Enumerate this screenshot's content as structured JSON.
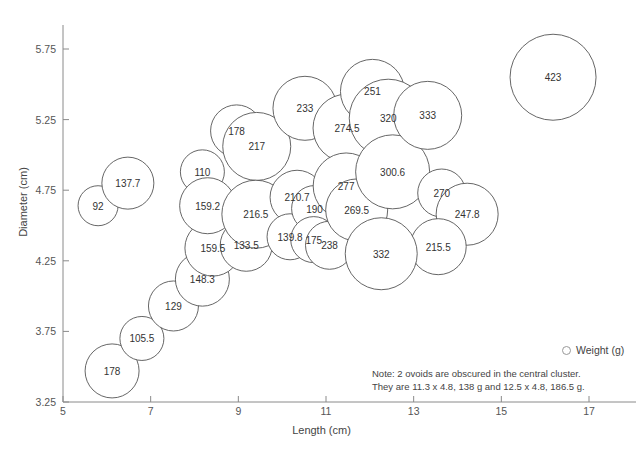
{
  "chart_data": {
    "type": "scatter",
    "title": "",
    "xlabel": "Length (cm)",
    "ylabel": "Diameter (cm)",
    "xlim": [
      5,
      17.8
    ],
    "ylim": [
      3.25,
      5.95
    ],
    "xticks": [
      "5",
      "7",
      "9",
      "11",
      "13",
      "15",
      "17"
    ],
    "yticks": [
      "3.25",
      "3.75",
      "4.25",
      "4.75",
      "5.25",
      "5.75"
    ],
    "grid": false,
    "legend": {
      "position": "bottom-right",
      "entries": [
        "Weight (g)"
      ],
      "marker": "open-circle"
    },
    "annotations": [
      "Note: 2 ovoids are obscured in the central cluster.",
      "They are 11.3 x 4.8, 138 g and 12.5 x 4.8, 186.5 g."
    ],
    "series_name": "Weight (g)",
    "point_label_units": "g",
    "bubble_outline_color": "#555555",
    "bubble_fill_color": "#ffffff",
    "points": [
      {
        "label": "92",
        "x": 5.8,
        "y": 4.64,
        "r": 20
      },
      {
        "label": "137.7",
        "x": 6.48,
        "y": 4.8,
        "r": 26
      },
      {
        "label": "178",
        "x": 6.12,
        "y": 3.47,
        "r": 27
      },
      {
        "label": "105.5",
        "x": 6.8,
        "y": 3.7,
        "r": 22
      },
      {
        "label": "129",
        "x": 7.52,
        "y": 3.93,
        "r": 25
      },
      {
        "label": "148.3",
        "x": 8.18,
        "y": 4.12,
        "r": 27
      },
      {
        "label": "159.5",
        "x": 8.42,
        "y": 4.34,
        "r": 28
      },
      {
        "label": "133.5",
        "x": 9.18,
        "y": 4.36,
        "r": 26
      },
      {
        "label": "110",
        "x": 8.18,
        "y": 4.88,
        "r": 22
      },
      {
        "label": "159.2",
        "x": 8.3,
        "y": 4.64,
        "r": 28
      },
      {
        "label": "178",
        "x": 8.96,
        "y": 5.17,
        "r": 26
      },
      {
        "label": "217",
        "x": 9.42,
        "y": 5.06,
        "r": 34
      },
      {
        "label": "216.5",
        "x": 9.4,
        "y": 4.58,
        "r": 34
      },
      {
        "label": "233",
        "x": 10.52,
        "y": 5.33,
        "r": 32
      },
      {
        "label": "210.7",
        "x": 10.34,
        "y": 4.7,
        "r": 27
      },
      {
        "label": "139.8",
        "x": 10.18,
        "y": 4.42,
        "r": 23
      },
      {
        "label": "190",
        "x": 10.74,
        "y": 4.62,
        "r": 23
      },
      {
        "label": "175",
        "x": 10.72,
        "y": 4.4,
        "r": 23
      },
      {
        "label": "238",
        "x": 11.08,
        "y": 4.36,
        "r": 24
      },
      {
        "label": "274.5",
        "x": 11.48,
        "y": 5.19,
        "r": 34
      },
      {
        "label": "277",
        "x": 11.46,
        "y": 4.78,
        "r": 33
      },
      {
        "label": "269.5",
        "x": 11.7,
        "y": 4.61,
        "r": 31
      },
      {
        "label": "251",
        "x": 12.06,
        "y": 5.45,
        "r": 32
      },
      {
        "label": "320",
        "x": 12.42,
        "y": 5.26,
        "r": 39
      },
      {
        "label": "300.6",
        "x": 12.52,
        "y": 4.88,
        "r": 37
      },
      {
        "label": "333",
        "x": 13.32,
        "y": 5.28,
        "r": 34
      },
      {
        "label": "270",
        "x": 13.64,
        "y": 4.73,
        "r": 24
      },
      {
        "label": "247.8",
        "x": 14.22,
        "y": 4.58,
        "r": 31
      },
      {
        "label": "215.5",
        "x": 13.56,
        "y": 4.35,
        "r": 28
      },
      {
        "label": "332",
        "x": 12.26,
        "y": 4.3,
        "r": 36
      },
      {
        "label": "423",
        "x": 16.18,
        "y": 5.55,
        "r": 43
      }
    ]
  },
  "axis": {
    "x_title": "Length (cm)",
    "y_title": "Diameter (cm)"
  },
  "legend": {
    "label": "Weight (g)"
  },
  "note": {
    "line1": "Note: 2 ovoids are obscured in the central cluster.",
    "line2": "They are 11.3 x 4.8, 138 g and 12.5 x 4.8, 186.5 g."
  }
}
